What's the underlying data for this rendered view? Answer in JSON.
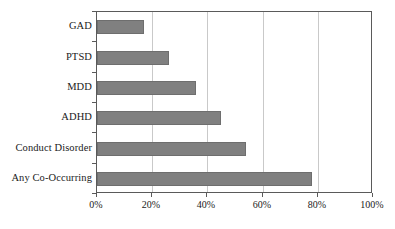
{
  "chart_data": {
    "type": "bar",
    "orientation": "horizontal",
    "title": "",
    "subtitle": "",
    "xlabel": "",
    "ylabel": "",
    "categories": [
      "Any Co-Occurring",
      "Conduct Disorder",
      "ADHD",
      "MDD",
      "PTSD",
      "GAD"
    ],
    "values": [
      78,
      54,
      45,
      36,
      26,
      17
    ],
    "value_labels": [
      "78%",
      "54%",
      "45%",
      "36%",
      "26%",
      "17%"
    ],
    "series": [
      {
        "name": "Prevalence",
        "values": [
          78,
          54,
          45,
          36,
          26,
          17
        ]
      }
    ],
    "xlim": [
      0,
      100
    ],
    "xticks": [
      0,
      20,
      40,
      60,
      80,
      100
    ],
    "xticklabels": [
      "0%",
      "20%",
      "40%",
      "60%",
      "80%",
      "100%"
    ],
    "grid": "vertical",
    "legend": "none",
    "bar_color": "#808080",
    "bar_border_color": "#6e6e6e",
    "gridline_color": "#c9c9c9",
    "axis_color": "#5a5a5a",
    "background_color": "#ffffff",
    "annotations": []
  },
  "axis": {
    "y_categories": [
      {
        "label": "GAD"
      },
      {
        "label": "PTSD"
      },
      {
        "label": "MDD"
      },
      {
        "label": "ADHD"
      },
      {
        "label": "Conduct Disorder"
      },
      {
        "label": "Any Co-Occurring"
      }
    ],
    "x_ticks": [
      {
        "label": "0%"
      },
      {
        "label": "20%"
      },
      {
        "label": "40%"
      },
      {
        "label": "60%"
      },
      {
        "label": "80%"
      },
      {
        "label": "100%"
      }
    ]
  }
}
